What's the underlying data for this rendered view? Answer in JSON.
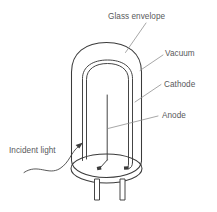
{
  "figure": {
    "background_color": "#ffffff",
    "line_color": "#3b3b3b",
    "leader_color": "#8a8a8a",
    "text_color": "#58595b"
  },
  "labels": {
    "glass_envelope": "Glass envelope",
    "vacuum": "Vacuum",
    "cathode": "Cathode",
    "anode": "Anode",
    "incident_light": "Incident light"
  },
  "parts": [
    {
      "id": "glass-envelope",
      "label": "Glass envelope",
      "description": "Outer dome-topped cylindrical glass bulb"
    },
    {
      "id": "vacuum",
      "label": "Vacuum",
      "description": "Evacuated interior space of the tube"
    },
    {
      "id": "cathode",
      "label": "Cathode",
      "description": "Curved inverted-U photoemissive plate inside the tube"
    },
    {
      "id": "anode",
      "label": "Anode",
      "description": "Straight vertical collector wire at the tube centre"
    },
    {
      "id": "incident-light",
      "label": "Incident light",
      "description": "Wavy ray arrow entering the tube from the lower left"
    },
    {
      "id": "base-plate",
      "label": "Base",
      "description": "Elliptical base disc of the tube"
    },
    {
      "id": "pins",
      "label": "Pins",
      "description": "Two rectangular connection pins below the base"
    }
  ]
}
